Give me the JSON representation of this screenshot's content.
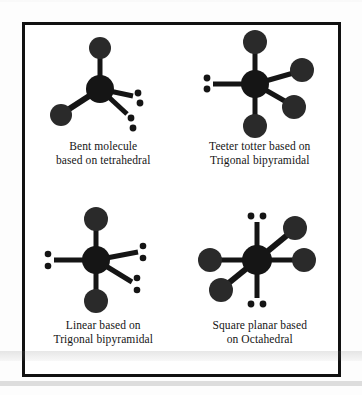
{
  "document": {
    "title": "VSEPR derived molecular shapes",
    "border_color": "#111111",
    "background_color": "#ffffff",
    "atom_color": "#151515",
    "bond_color": "#151515"
  },
  "figures": [
    {
      "id": "bent-molecule",
      "caption_line1": "Bent molecule",
      "caption_line2": "based on  tetrahedral",
      "shape_name": "bent",
      "parent_geometry": "tetrahedral",
      "bonded_atoms": 2,
      "lone_pairs": 2,
      "central_atom_radius": 14,
      "terminal_atom_radius": 10,
      "bonds": [
        {
          "angle_deg": 90,
          "length": 42,
          "terminal": "atom"
        },
        {
          "angle_deg": 205,
          "length": 42,
          "terminal": "atom"
        },
        {
          "angle_deg": 340,
          "length": 34,
          "terminal": "lone-pair"
        },
        {
          "angle_deg": 305,
          "length": 34,
          "terminal": "lone-pair"
        }
      ]
    },
    {
      "id": "teeter-totter",
      "caption_line1": "Teeter  totter  based on",
      "caption_line2": "Trigonal bipyramidal",
      "shape_name": "teeter totter",
      "parent_geometry": "trigonal bipyramidal",
      "bonded_atoms": 4,
      "lone_pairs": 1,
      "central_atom_radius": 14,
      "terminal_atom_radius": 11,
      "bonds": [
        {
          "angle_deg": 90,
          "length": 44,
          "terminal": "atom"
        },
        {
          "angle_deg": 270,
          "length": 44,
          "terminal": "atom"
        },
        {
          "angle_deg": 20,
          "length": 42,
          "terminal": "atom"
        },
        {
          "angle_deg": 332,
          "length": 40,
          "terminal": "atom"
        },
        {
          "angle_deg": 180,
          "length": 36,
          "terminal": "lone-pair"
        }
      ]
    },
    {
      "id": "linear-molecule",
      "caption_line1": "Linear  based on",
      "caption_line2": "Trigonal bipyramidal",
      "shape_name": "linear",
      "parent_geometry": "trigonal bipyramidal",
      "bonded_atoms": 2,
      "lone_pairs": 3,
      "central_atom_radius": 14,
      "terminal_atom_radius": 11,
      "bonds": [
        {
          "angle_deg": 90,
          "length": 44,
          "terminal": "atom"
        },
        {
          "angle_deg": 270,
          "length": 44,
          "terminal": "atom"
        },
        {
          "angle_deg": 180,
          "length": 36,
          "terminal": "lone-pair"
        },
        {
          "angle_deg": 12,
          "length": 40,
          "terminal": "lone-pair"
        },
        {
          "angle_deg": 325,
          "length": 36,
          "terminal": "lone-pair"
        }
      ]
    },
    {
      "id": "square-planar",
      "caption_line1": "Square planar based",
      "caption_line2": "on  Octahedral",
      "shape_name": "square planar",
      "parent_geometry": "octahedral",
      "bonded_atoms": 4,
      "lone_pairs": 2,
      "central_atom_radius": 15,
      "terminal_atom_radius": 11,
      "bonds": [
        {
          "angle_deg": 180,
          "length": 42,
          "terminal": "atom"
        },
        {
          "angle_deg": 0,
          "length": 44,
          "terminal": "atom"
        },
        {
          "angle_deg": 38,
          "length": 44,
          "terminal": "atom"
        },
        {
          "angle_deg": 218,
          "length": 42,
          "terminal": "atom"
        },
        {
          "angle_deg": 90,
          "length": 42,
          "terminal": "lone-pair-h"
        },
        {
          "angle_deg": 270,
          "length": 42,
          "terminal": "lone-pair-h"
        }
      ]
    }
  ]
}
